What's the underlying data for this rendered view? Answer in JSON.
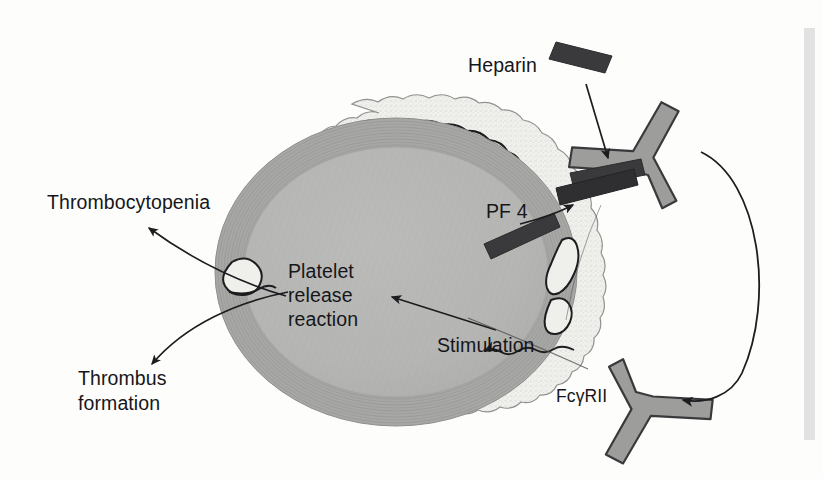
{
  "figure": {
    "background_color": "#fdfdfc",
    "line_color": "#1d1d20",
    "page_gutter_color": "#e2e2e2"
  },
  "labels": {
    "heparin": "Heparin",
    "pf4": "PF 4",
    "fc_receptor": "FcγRII",
    "thrombocytopenia": "Thrombocytopenia",
    "platelet_release_line1": "Platelet",
    "platelet_release_line2": "release",
    "platelet_release_line3": "reaction",
    "thrombus_line1": "Thrombus",
    "thrombus_line2": "formation",
    "stimulation": "Stimulation"
  },
  "elements": {
    "platelet": {
      "name": "platelet cell",
      "membrane_fill": "#efefec",
      "membrane_stroke": "#8a8a88",
      "inner_membrane_stroke": "#1d1d20",
      "cytoplasm_fill": "#b6b6b4",
      "microtubule_band_fill": "#a4a4a2",
      "microtubule_stroke": "#8e8e8c"
    },
    "heparin_bar": {
      "name": "heparin molecule bar",
      "color": "#3a3a3c",
      "count": 3
    },
    "pf4_bar": {
      "name": "platelet factor 4 bar",
      "color": "#3a3a3c"
    },
    "receptor_upper": {
      "name": "immune complex antibody (upper Y)",
      "color": "#9d9d9b",
      "stroke": "#3a3a3c"
    },
    "receptor_lower": {
      "name": "Fc gamma RII receptor (lower Y)",
      "color": "#9d9d9b",
      "stroke": "#3a3a3c"
    },
    "arrows": [
      {
        "name": "heparin-to-complex-arrow",
        "from": "Heparin",
        "to": "antibody complex"
      },
      {
        "name": "pf4-to-heparin-arrow",
        "from": "PF 4",
        "to": "heparin bar"
      },
      {
        "name": "complex-to-receptor-arc",
        "from": "immune complex",
        "to": "FcγRII"
      },
      {
        "name": "stimulation-arrow",
        "from": "FcγRII stimulation",
        "to": "platelet interior",
        "style": "wavy"
      },
      {
        "name": "release-reaction-arrow",
        "from": "stimulation",
        "to": "Platelet release reaction"
      },
      {
        "name": "thrombocytopenia-arrow",
        "from": "platelet",
        "to": "Thrombocytopenia"
      },
      {
        "name": "thrombus-arrow",
        "from": "platelet",
        "to": "Thrombus formation"
      }
    ]
  }
}
